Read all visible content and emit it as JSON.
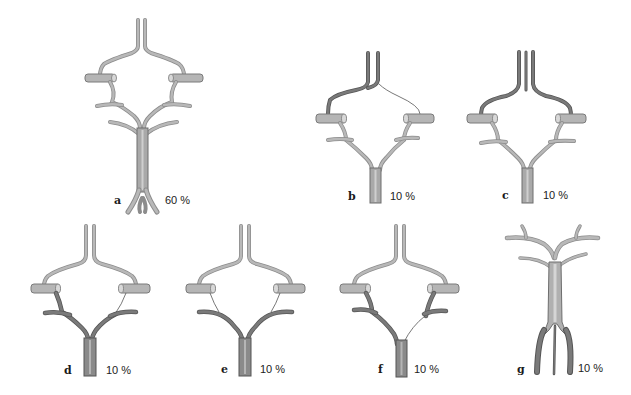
{
  "figure": {
    "colors": {
      "background": "#ffffff",
      "vessel_light": "#b8b8b8",
      "vessel_dark": "#7a7a7a",
      "outline": "#555555",
      "text": "#1a1a1a"
    },
    "panels": [
      {
        "id": "a",
        "letter": "a",
        "percent": "60 %"
      },
      {
        "id": "b",
        "letter": "b",
        "percent": "10 %"
      },
      {
        "id": "c",
        "letter": "c",
        "percent": "10 %"
      },
      {
        "id": "d",
        "letter": "d",
        "percent": "10 %"
      },
      {
        "id": "e",
        "letter": "e",
        "percent": "10 %"
      },
      {
        "id": "f",
        "letter": "f",
        "percent": "10 %"
      },
      {
        "id": "g",
        "letter": "g",
        "percent": "10 %"
      }
    ]
  }
}
